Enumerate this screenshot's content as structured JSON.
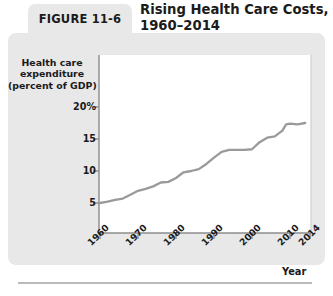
{
  "figure": {
    "tab_label": "FIGURE 11-6",
    "title_line1": "Rising Health Care Costs,",
    "title_line2": "1960–2014"
  },
  "colors": {
    "card_background": "#e8e8e8",
    "plot_background": "#ffffff",
    "series_line": "#9a9a9a",
    "axis_line": "#8c8c8c",
    "text": "#1b1b1b",
    "footer_rule": "#b9b9b9"
  },
  "chart_data": {
    "type": "line",
    "title": "Rising Health Care Costs, 1960–2014",
    "xlabel": "Year",
    "ylabel": "Health care expenditure (percent of GDP)",
    "ylabel_line1": "Health care",
    "ylabel_line2": "expenditure",
    "ylabel_line3": "(percent of GDP)",
    "grid": false,
    "legend": "none",
    "xlim": [
      1960,
      2014
    ],
    "ylim": [
      4.0,
      21.5
    ],
    "ytick_labels": [
      "20%",
      "15",
      "10",
      "5"
    ],
    "ytick_values": [
      20,
      15,
      10,
      5
    ],
    "xtick_labels": [
      "1960",
      "1970",
      "1980",
      "1990",
      "2000",
      "2010",
      "2014"
    ],
    "xtick_values": [
      1960,
      1970,
      1980,
      1990,
      2000,
      2010,
      2014
    ],
    "series": [
      {
        "name": "Health care expenditure (percent of GDP)",
        "x": [
          1960,
          1962,
          1964,
          1966,
          1968,
          1970,
          1972,
          1974,
          1976,
          1978,
          1980,
          1982,
          1984,
          1986,
          1988,
          1990,
          1992,
          1994,
          1996,
          1998,
          2000,
          2002,
          2004,
          2006,
          2008,
          2009,
          2010,
          2012,
          2014
        ],
        "values": [
          5.0,
          5.2,
          5.5,
          5.7,
          6.3,
          6.9,
          7.2,
          7.6,
          8.2,
          8.3,
          8.9,
          9.8,
          10.0,
          10.3,
          11.1,
          12.1,
          13.0,
          13.3,
          13.3,
          13.3,
          13.4,
          14.5,
          15.2,
          15.4,
          16.3,
          17.3,
          17.4,
          17.3,
          17.5
        ]
      }
    ]
  },
  "axis_geometry": {
    "plot_left_px": 99,
    "plot_right_px": 311,
    "plot_top_px": 55,
    "plot_bottom_px": 233,
    "y_px_20": 107,
    "y_px_15": 139,
    "y_px_10": 171,
    "y_px_5": 203,
    "x_px_1960": 100,
    "x_px_1970": 138,
    "x_px_1980": 176,
    "x_px_1990": 214,
    "x_px_2000": 252,
    "x_px_2010": 290,
    "x_px_2014": 310
  }
}
